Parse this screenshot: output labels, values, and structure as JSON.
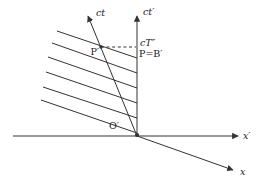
{
  "figure": {
    "background": "#ffffff",
    "line_color": "#333333",
    "text_color": "#222222",
    "width": 258,
    "height": 194,
    "axes": [
      {
        "name": "x-prime-axis",
        "label": "x′",
        "from": [
          13,
          136
        ],
        "to": [
          238,
          136
        ],
        "label_pos": [
          243,
          139
        ],
        "anchor": "start",
        "italic": true
      },
      {
        "name": "ct-prime-axis",
        "label": "ct′",
        "from": [
          137,
          136
        ],
        "to": [
          137,
          16
        ],
        "label_pos": [
          143,
          15
        ],
        "anchor": "start",
        "italic": true
      },
      {
        "name": "ct-axis",
        "label": "ct",
        "from": [
          137,
          136
        ],
        "to": [
          88,
          16
        ],
        "label_pos": [
          96,
          16
        ],
        "anchor": "start",
        "italic": true
      },
      {
        "name": "x-axis",
        "label": "x",
        "from": [
          137,
          136
        ],
        "to": [
          233,
          170
        ],
        "label_pos": [
          240,
          175
        ],
        "anchor": "start",
        "italic": true
      }
    ],
    "hatch_lines": [
      [
        57,
        31,
        137,
        58
      ],
      [
        52,
        43,
        137,
        73
      ],
      [
        48,
        57,
        137,
        88
      ],
      [
        46,
        72,
        137,
        103
      ],
      [
        43,
        87,
        137,
        118
      ],
      [
        41,
        100,
        137,
        133
      ]
    ],
    "dashed_line": [
      101,
      47,
      136,
      47
    ],
    "points": [
      {
        "name": "P-prime-point",
        "at": [
          101,
          47
        ],
        "r": 1.8
      },
      {
        "name": "origin-point",
        "at": [
          137,
          135
        ],
        "r": 2.1
      }
    ],
    "labels": [
      {
        "name": "P-prime-label",
        "text": "P′",
        "pos": [
          99,
          55
        ],
        "anchor": "end",
        "italic": false
      },
      {
        "name": "cT-doubleprime-label",
        "text": "cT″",
        "pos": [
          140,
          46
        ],
        "anchor": "start",
        "italic": true
      },
      {
        "name": "P-equals-B-prime-label",
        "text": "P=B′",
        "pos": [
          139,
          57
        ],
        "anchor": "start",
        "italic": false
      },
      {
        "name": "O-prime-label",
        "text": "O′",
        "pos": [
          109,
          129
        ],
        "anchor": "start",
        "italic": false
      }
    ]
  }
}
